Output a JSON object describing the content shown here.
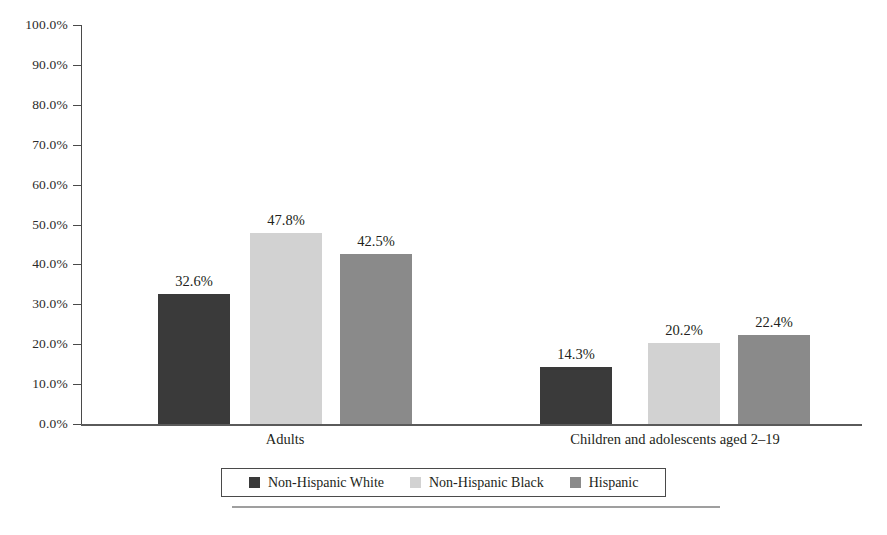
{
  "chart_data": {
    "type": "bar",
    "title": "",
    "subtitle": "",
    "xlabel": "",
    "ylabel": "",
    "categories": [
      "Adults",
      "Children and adolescents aged 2–19"
    ],
    "series": [
      {
        "name": "Non-Hispanic White",
        "color": "#3a3a3a",
        "values": [
          32.6,
          47.8
        ],
        "labels": [
          "32.6%",
          "14.3%"
        ]
      },
      {
        "name": "Non-Hispanic Black",
        "color": "#d2d2d2",
        "values": [
          47.8,
          20.2
        ],
        "labels": [
          "47.8%",
          "20.2%"
        ]
      },
      {
        "name": "Hispanic",
        "color": "#8a8a8a",
        "values": [
          42.5,
          22.4
        ],
        "labels": [
          "42.5%",
          "22.4%"
        ]
      }
    ],
    "bars": [
      {
        "group": "Adults",
        "series": "Non-Hispanic White",
        "value": 32.6,
        "label": "32.6%",
        "color": "#3a3a3a"
      },
      {
        "group": "Adults",
        "series": "Non-Hispanic Black",
        "value": 47.8,
        "label": "47.8%",
        "color": "#d2d2d2"
      },
      {
        "group": "Adults",
        "series": "Hispanic",
        "value": 42.5,
        "label": "42.5%",
        "color": "#8a8a8a"
      },
      {
        "group": "Children and adolescents aged 2–19",
        "series": "Non-Hispanic White",
        "value": 14.3,
        "label": "14.3%",
        "color": "#3a3a3a"
      },
      {
        "group": "Children and adolescents aged 2–19",
        "series": "Non-Hispanic Black",
        "value": 20.2,
        "label": "20.2%",
        "color": "#d2d2d2"
      },
      {
        "group": "Children and adolescents aged 2–19",
        "series": "Hispanic",
        "value": 22.4,
        "label": "22.4%",
        "color": "#8a8a8a"
      }
    ],
    "ylim": [
      0,
      100
    ],
    "ytick_values": [
      100,
      90,
      80,
      70,
      60,
      50,
      40,
      30,
      20,
      10,
      0
    ],
    "ytick_labels": [
      "100.0%",
      "90.0%",
      "80.0%",
      "70.0%",
      "60.0%",
      "50.0%",
      "40.0%",
      "30.0%",
      "20.0%",
      "10.0%",
      "0.0%"
    ],
    "grid": false,
    "legend_position": "bottom"
  },
  "axis": {
    "ticks": [
      {
        "label": "100.0%",
        "value": 100
      },
      {
        "label": "90.0%",
        "value": 90
      },
      {
        "label": "80.0%",
        "value": 80
      },
      {
        "label": "70.0%",
        "value": 70
      },
      {
        "label": "60.0%",
        "value": 60
      },
      {
        "label": "50.0%",
        "value": 50
      },
      {
        "label": "40.0%",
        "value": 40
      },
      {
        "label": "30.0%",
        "value": 30
      },
      {
        "label": "20.0%",
        "value": 20
      },
      {
        "label": "10.0%",
        "value": 10
      },
      {
        "label": "0.0%",
        "value": 0
      }
    ]
  },
  "groups": [
    {
      "label": "Adults",
      "center_pct": 36.5
    },
    {
      "label": "Children and adolescents aged 2–19",
      "center_pct": 85.5
    }
  ],
  "legend": {
    "items": [
      {
        "label": "Non-Hispanic White",
        "color": "#3a3a3a"
      },
      {
        "label": "Non-Hispanic Black",
        "color": "#d2d2d2"
      },
      {
        "label": "Hispanic",
        "color": "#8a8a8a"
      }
    ]
  },
  "colors": {
    "non_hispanic_white": "#3a3a3a",
    "non_hispanic_black": "#d2d2d2",
    "hispanic": "#8a8a8a",
    "axis": "#4a4a4a",
    "text": "#231f20",
    "background": "#ffffff"
  }
}
